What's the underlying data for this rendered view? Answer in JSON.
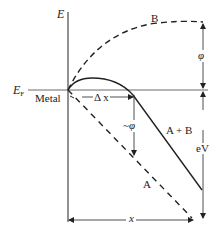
{
  "diagram": {
    "type": "energy band diagram (metal surface potential)",
    "axis": {
      "vertical_label": "E",
      "fermi_level_label": "E",
      "fermi_level_subscript": "F",
      "region_label": "Metal"
    },
    "curves": [
      {
        "id": "A",
        "label": "A",
        "style": "dashed",
        "description": "applied field potential (straight line)"
      },
      {
        "id": "B",
        "label": "B",
        "style": "dashed",
        "description": "image potential"
      },
      {
        "id": "A+B",
        "label": "A + B",
        "style": "solid",
        "description": "total potential barrier"
      }
    ],
    "annotations": {
      "delta_x": "Δ x",
      "barrier_reduction": "~φ",
      "work_function": "φ",
      "applied_energy": "eV",
      "distance": "x"
    },
    "colors": {
      "line": "#222222",
      "background": "#ffffff"
    }
  }
}
